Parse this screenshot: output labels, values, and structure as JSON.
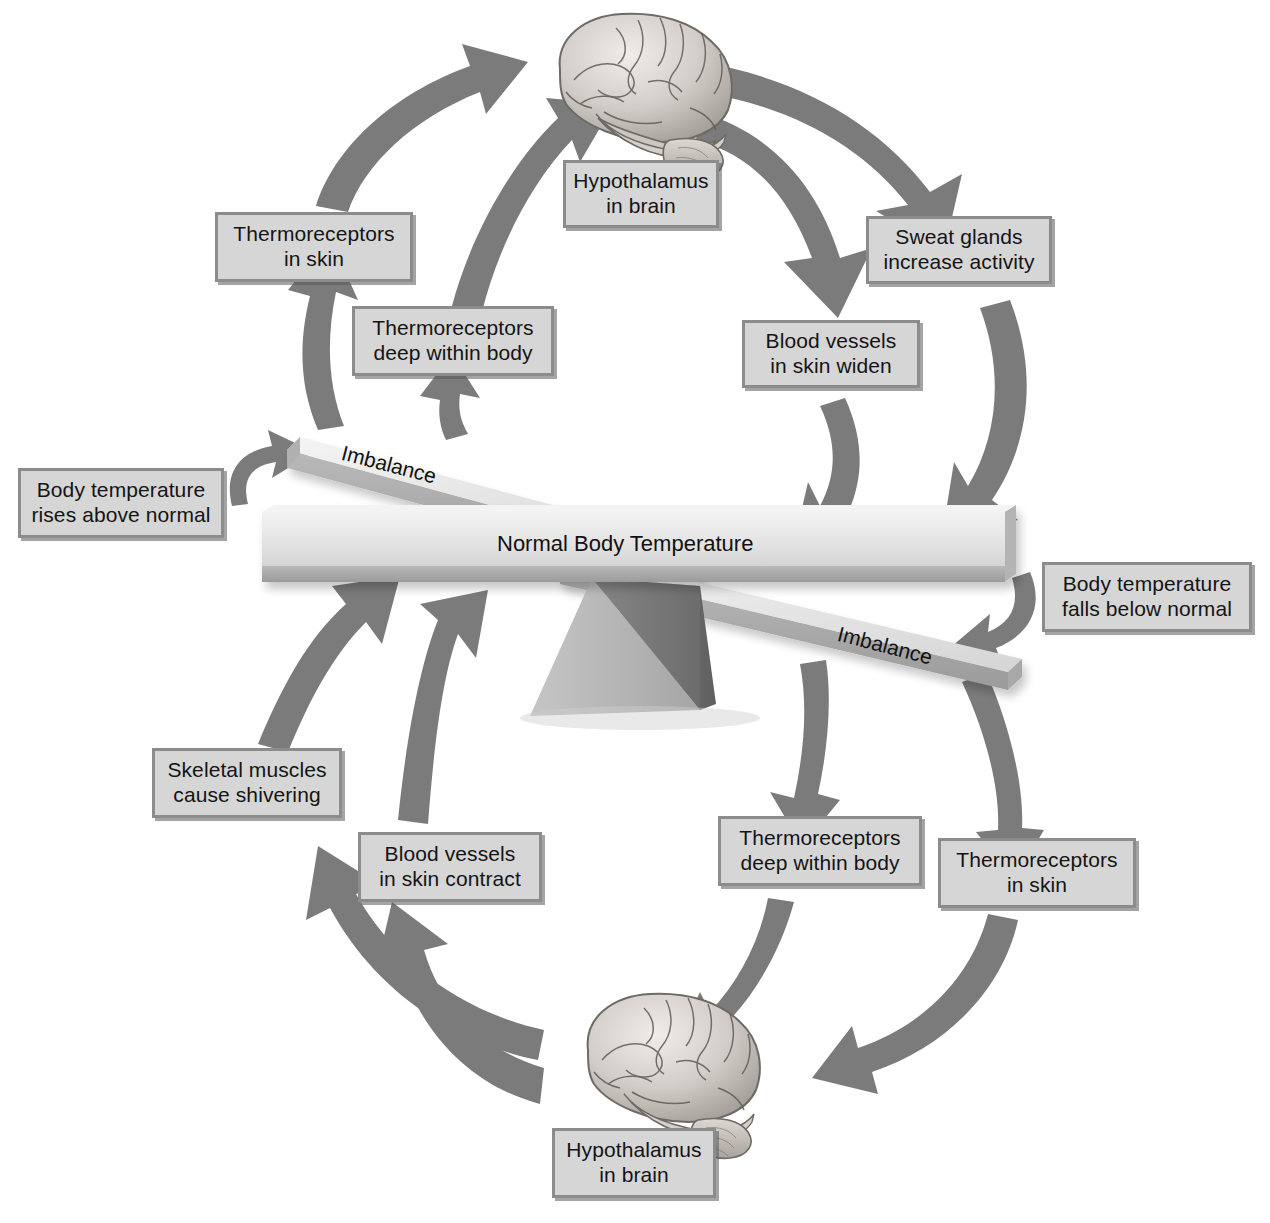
{
  "diagram": {
    "palette": {
      "arrow_gray": "#7b7b7b",
      "arrow_gray_dark": "#6a6a6a",
      "box_fill": "#d6d6d6",
      "box_border": "#8c8c8c",
      "beam_light": "#e6e6e6",
      "beam_mid": "#c9c9c9",
      "beam_dark": "#9e9e9e",
      "fulcrum_light": "#b5b5b5",
      "fulcrum_dark": "#6f6f6f",
      "text": "#141414",
      "background": "#ffffff"
    },
    "balance": {
      "center_label": "Normal Body Temperature",
      "left_arm_label": "Imbalance",
      "right_arm_label": "Imbalance"
    },
    "organs": [
      {
        "name": "brain-top",
        "label": "brain"
      },
      {
        "name": "brain-bottom",
        "label": "brain"
      }
    ],
    "nodes": {
      "hypothalamus_top": {
        "lines": [
          "Hypothalamus",
          "in brain"
        ]
      },
      "sweat_glands": {
        "lines": [
          "Sweat glands",
          "increase activity"
        ]
      },
      "blood_vessels_widen": {
        "lines": [
          "Blood vessels",
          "in skin widen"
        ]
      },
      "thermoreceptors_skin_top": {
        "lines": [
          "Thermoreceptors",
          "in skin"
        ]
      },
      "thermoreceptors_deep_top": {
        "lines": [
          "Thermoreceptors",
          "deep within body"
        ]
      },
      "temp_rises": {
        "lines": [
          "Body temperature",
          "rises above normal"
        ]
      },
      "temp_falls": {
        "lines": [
          "Body temperature",
          "falls below normal"
        ]
      },
      "skeletal_muscles": {
        "lines": [
          "Skeletal muscles",
          "cause shivering"
        ]
      },
      "blood_vessels_contract": {
        "lines": [
          "Blood vessels",
          "in skin contract"
        ]
      },
      "thermoreceptors_deep_bot": {
        "lines": [
          "Thermoreceptors",
          "deep within body"
        ]
      },
      "thermoreceptors_skin_bot": {
        "lines": [
          "Thermoreceptors",
          "in skin"
        ]
      },
      "hypothalamus_bottom": {
        "lines": [
          "Hypothalamus",
          "in brain"
        ]
      }
    },
    "arrows": [
      {
        "name": "hypothalamus-to-sweat-glands",
        "from": "hypothalamus_top",
        "to": "sweat_glands"
      },
      {
        "name": "hypothalamus-to-blood-vessels",
        "from": "hypothalamus_top",
        "to": "blood_vessels_widen"
      },
      {
        "name": "sweat-glands-to-beam",
        "from": "sweat_glands",
        "to": "balance"
      },
      {
        "name": "blood-vessels-widen-to-beam",
        "from": "blood_vessels_widen",
        "to": "balance"
      },
      {
        "name": "temp-rises-to-left-arm",
        "from": "temp_rises",
        "to": "left_arm"
      },
      {
        "name": "left-arm-to-thermoreceptors-skin",
        "from": "left_arm",
        "to": "thermoreceptors_skin_top"
      },
      {
        "name": "left-arm-to-thermoreceptors-deep",
        "from": "left_arm",
        "to": "thermoreceptors_deep_top"
      },
      {
        "name": "thermoreceptors-skin-to-brain",
        "from": "thermoreceptors_skin_top",
        "to": "hypothalamus_top"
      },
      {
        "name": "thermoreceptors-deep-to-brain",
        "from": "thermoreceptors_deep_top",
        "to": "hypothalamus_top"
      },
      {
        "name": "temp-falls-to-right-arm",
        "from": "temp_falls",
        "to": "right_arm"
      },
      {
        "name": "right-arm-to-thermo-deep-bottom",
        "from": "right_arm",
        "to": "thermoreceptors_deep_bot"
      },
      {
        "name": "right-arm-to-thermo-skin-bottom",
        "from": "right_arm",
        "to": "thermoreceptors_skin_bot"
      },
      {
        "name": "thermo-deep-bottom-to-brain",
        "from": "thermoreceptors_deep_bot",
        "to": "hypothalamus_bottom"
      },
      {
        "name": "thermo-skin-bottom-to-brain",
        "from": "thermoreceptors_skin_bot",
        "to": "hypothalamus_bottom"
      },
      {
        "name": "brain-to-skeletal-muscles",
        "from": "hypothalamus_bottom",
        "to": "skeletal_muscles"
      },
      {
        "name": "brain-to-blood-vessels-contract",
        "from": "hypothalamus_bottom",
        "to": "blood_vessels_contract"
      },
      {
        "name": "skeletal-muscles-to-beam",
        "from": "skeletal_muscles",
        "to": "balance"
      },
      {
        "name": "blood-vessels-contract-to-beam",
        "from": "blood_vessels_contract",
        "to": "balance"
      }
    ]
  }
}
